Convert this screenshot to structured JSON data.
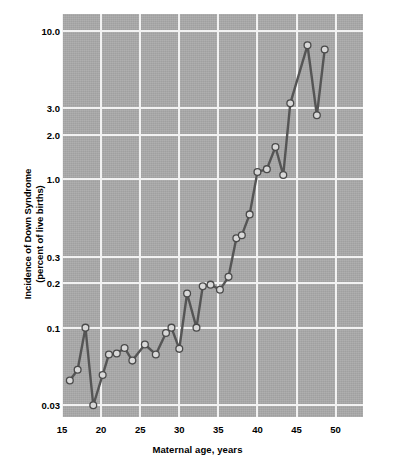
{
  "chart_data": {
    "type": "line",
    "title": "",
    "xlabel": "Maternal age, years",
    "ylabel": "Incidence of Down Syndrome\n(percent of live births)",
    "ylabel_line1": "Incidence of Down Syndrome",
    "ylabel_line2": "(percent of live births)",
    "yscale": "log",
    "xscale": "linear",
    "xlim": [
      15,
      53.5
    ],
    "ylim": [
      0.025,
      13.0
    ],
    "grid": true,
    "legend": "none",
    "xticks": [
      15,
      20,
      25,
      30,
      35,
      40,
      45,
      50
    ],
    "xtick_labels": [
      "15",
      "20",
      "25",
      "30",
      "35",
      "40",
      "45",
      "50"
    ],
    "yticks": [
      0.03,
      0.1,
      0.2,
      0.3,
      1.0,
      2.0,
      3.0,
      10.0
    ],
    "ytick_labels": [
      "0.03",
      "0.1",
      "0.2",
      "0.3",
      "1.0",
      "2.0",
      "3.0",
      "10.0"
    ],
    "series": [
      {
        "name": "Incidence of Down Syndrome",
        "marker": "circle",
        "line_color": "#555555",
        "marker_face_color": "#d8d8d8",
        "marker_edge_color": "#4a4a4a",
        "x": [
          16.0,
          17.0,
          18.0,
          19.0,
          20.2,
          21.0,
          22.0,
          23.0,
          24.0,
          25.6,
          27.0,
          28.3,
          29.0,
          30.0,
          31.0,
          32.2,
          33.0,
          34.0,
          35.2,
          36.3,
          37.3,
          38.0,
          39.0,
          40.0,
          41.2,
          42.3,
          43.3,
          44.2,
          46.4,
          47.6,
          48.6
        ],
        "y": [
          0.044,
          0.052,
          0.1,
          0.03,
          0.048,
          0.066,
          0.067,
          0.073,
          0.06,
          0.077,
          0.066,
          0.092,
          0.1,
          0.072,
          0.17,
          0.1,
          0.19,
          0.195,
          0.18,
          0.22,
          0.4,
          0.42,
          0.58,
          1.12,
          1.17,
          1.65,
          1.07,
          3.25,
          8.0,
          2.7,
          7.5
        ]
      }
    ]
  },
  "axes": {
    "plot_background": "#a9a9a9",
    "gridline_color": "#f2f2f2"
  }
}
